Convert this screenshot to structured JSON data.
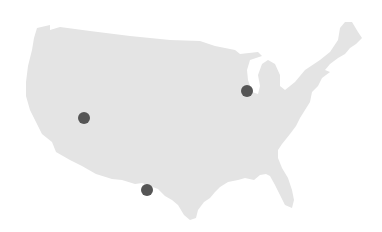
{
  "map": {
    "region": "United States (contiguous)",
    "land_color": "#e4e4e4",
    "background_color": "#ffffff",
    "marker_color": "#555555",
    "markers": [
      {
        "id": "marker-west",
        "cx": 84,
        "cy": 118,
        "r": 6
      },
      {
        "id": "marker-midwest",
        "cx": 247,
        "cy": 91,
        "r": 6
      },
      {
        "id": "marker-southwest",
        "cx": 147,
        "cy": 190,
        "r": 6
      }
    ]
  }
}
